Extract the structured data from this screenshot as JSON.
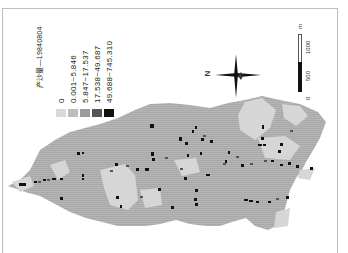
{
  "map": {
    "legend": {
      "title": "产沙量—19840804",
      "items": [
        {
          "label": "0",
          "color": "#d9d9d9"
        },
        {
          "label": "0.001~5.846",
          "color": "#bdbdbd"
        },
        {
          "label": "5.847~17.537",
          "color": "#9c9c9c"
        },
        {
          "label": "17.538~49.687",
          "color": "#555555"
        },
        {
          "label": "49.688~745.310",
          "color": "#111111"
        }
      ]
    },
    "north_arrow": {
      "label": "N",
      "orientation": "points left (map rotated 90°)"
    },
    "scale_bar": {
      "unit": "m",
      "ticks": [
        "0",
        "500",
        "1000"
      ]
    },
    "colors": {
      "background": "#ffffff",
      "catchment_main": "#b3b3b3",
      "catchment_light": "#d6d6d6",
      "frame": "#bdbdbd"
    }
  }
}
